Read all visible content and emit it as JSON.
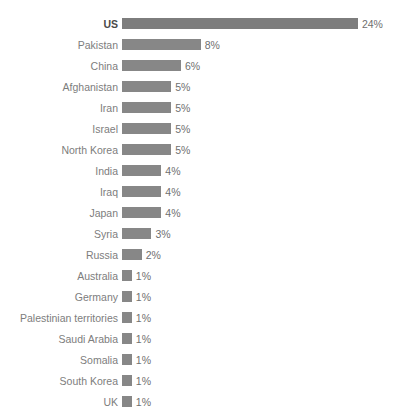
{
  "chart_data": {
    "type": "bar",
    "orientation": "horizontal",
    "title": "",
    "xlabel": "",
    "ylabel": "",
    "value_suffix": "%",
    "xlim": [
      0,
      24
    ],
    "grid": false,
    "legend": null,
    "bar_color": "#878787",
    "label_color": "#7d7d7d",
    "highlight_label_color": "#4a4a4a",
    "background": "#ffffff",
    "px_per_unit": 9.83,
    "categories": [
      "US",
      "Pakistan",
      "China",
      "Afghanistan",
      "Iran",
      "Israel",
      "North Korea",
      "India",
      "Iraq",
      "Japan",
      "Syria",
      "Russia",
      "Australia",
      "Germany",
      "Palestinian territories",
      "Saudi Arabia",
      "Somalia",
      "South Korea",
      "UK"
    ],
    "values": [
      24,
      8,
      6,
      5,
      5,
      5,
      5,
      4,
      4,
      4,
      3,
      2,
      1,
      1,
      1,
      1,
      1,
      1,
      1
    ],
    "value_labels": [
      "24%",
      "8%",
      "6%",
      "5%",
      "5%",
      "5%",
      "5%",
      "4%",
      "4%",
      "4%",
      "3%",
      "2%",
      "1%",
      "1%",
      "1%",
      "1%",
      "1%",
      "1%",
      "1%"
    ],
    "highlighted": [
      "US"
    ]
  }
}
